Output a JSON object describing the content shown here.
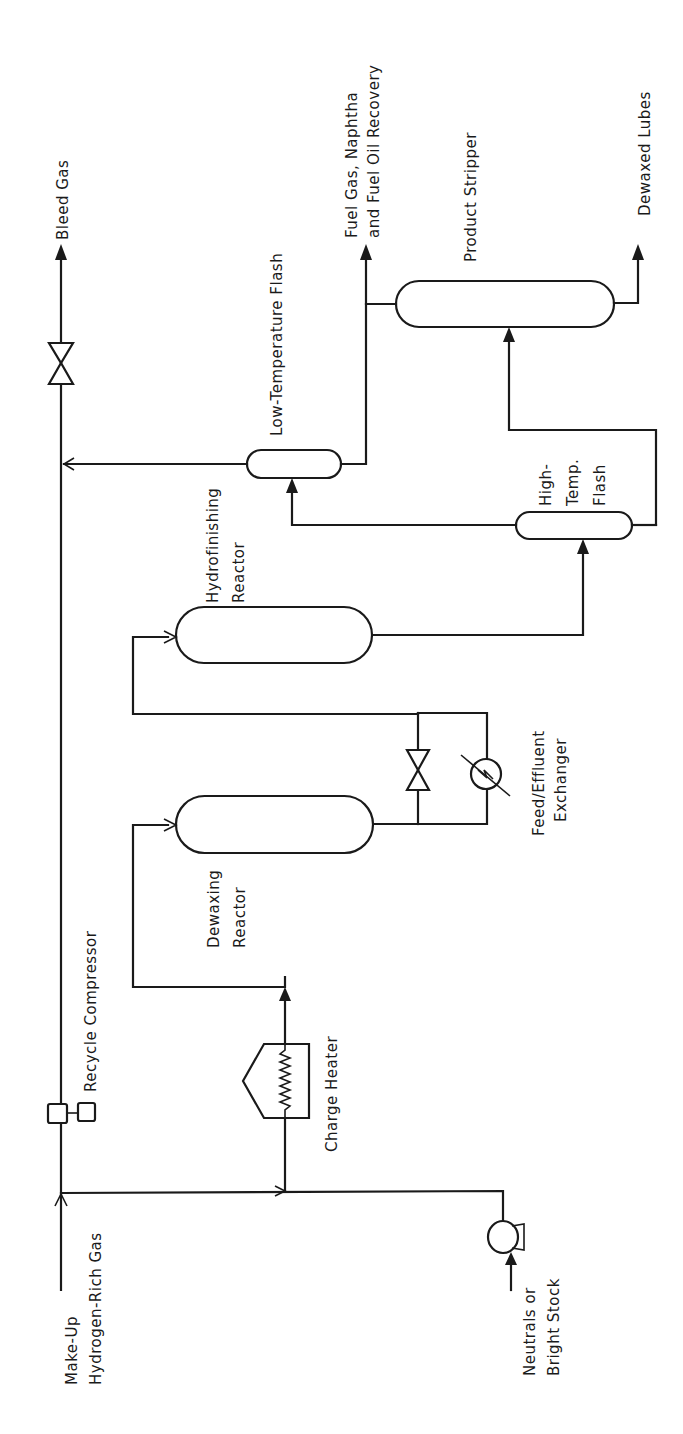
{
  "diagram": {
    "text_orientation": "rotated 90° counter-clockwise",
    "streams": {
      "bleed_gas": "Bleed Gas",
      "fuel_gas_line1": "Fuel Gas, Naphtha",
      "fuel_gas_line2": "and Fuel Oil Recovery",
      "dewaxed_lubes": "Dewaxed Lubes",
      "makeup_line1": "Make-Up",
      "makeup_line2": "Hydrogen-Rich Gas",
      "feed_line1": "Neutrals or",
      "feed_line2": "Bright Stock"
    },
    "equipment": {
      "product_stripper": "Product Stripper",
      "low_temp_flash": "Low-Temperature Flash",
      "high_temp_flash_line1": "High-",
      "high_temp_flash_line2": "Temp.",
      "high_temp_flash_line3": "Flash",
      "hydrofinishing_line1": "Hydrofinishing",
      "hydrofinishing_line2": "Reactor",
      "dewaxing_line1": "Dewaxing",
      "dewaxing_line2": "Reactor",
      "exchanger_line1": "Feed/Effluent",
      "exchanger_line2": "Exchanger",
      "recycle_compressor": "Recycle Compressor",
      "charge_heater": "Charge Heater"
    },
    "colors": {
      "line": "#1a1a1a",
      "background": "#ffffff"
    }
  }
}
